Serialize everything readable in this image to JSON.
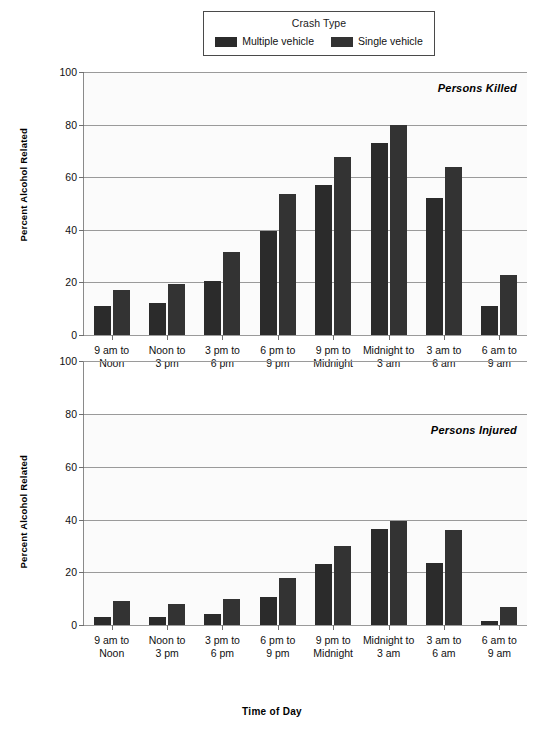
{
  "legend": {
    "title": "Crash Type",
    "entries": [
      {
        "label": "Multiple vehicle",
        "color": "#2b2b2b"
      },
      {
        "label": "Single vehicle",
        "color": "#333333"
      }
    ]
  },
  "axes": {
    "ylabel": "Percent Alcohol Related",
    "xlabel": "Time of Day"
  },
  "panels": [
    {
      "annotation": "Persons Killed"
    },
    {
      "annotation": "Persons Injured"
    }
  ],
  "chart_data": [
    {
      "type": "bar",
      "title": "Persons Killed",
      "xlabel": "Time of Day",
      "ylabel": "Percent Alcohol Related",
      "ylim": [
        0,
        100
      ],
      "yticks": [
        0,
        20,
        40,
        60,
        80,
        100
      ],
      "grid": true,
      "legend_position": "top-center",
      "categories": [
        "9 am to Noon",
        "Noon to 3 pm",
        "3 pm to 6 pm",
        "6 pm to 9 pm",
        "9 pm to Midnight",
        "Midnight to 3 am",
        "3 am to 6 am",
        "6 am to 9 am"
      ],
      "series": [
        {
          "name": "Multiple vehicle",
          "values": [
            11,
            12,
            20.5,
            39.5,
            57,
            73,
            52,
            11
          ]
        },
        {
          "name": "Single vehicle",
          "values": [
            17,
            19.5,
            31.5,
            53.5,
            67.5,
            80,
            64,
            23
          ]
        }
      ]
    },
    {
      "type": "bar",
      "title": "Persons Injured",
      "xlabel": "Time of Day",
      "ylabel": "Percent Alcohol Related",
      "ylim": [
        0,
        100
      ],
      "yticks": [
        0,
        20,
        40,
        60,
        80,
        100
      ],
      "grid": true,
      "legend_position": "top-center",
      "categories": [
        "9 am to Noon",
        "Noon to 3 pm",
        "3 pm to 6 pm",
        "6 pm to 9 pm",
        "9 pm to Midnight",
        "Midnight to 3 am",
        "3 am to 6 am",
        "6 am to 9 am"
      ],
      "series": [
        {
          "name": "Multiple vehicle",
          "values": [
            3,
            3,
            4,
            10.5,
            23,
            36.5,
            23.5,
            1.5
          ]
        },
        {
          "name": "Single vehicle",
          "values": [
            9,
            8,
            10,
            18,
            30,
            39.5,
            36,
            7
          ]
        }
      ]
    }
  ],
  "xtick_labels": [
    {
      "line1": "9 am to",
      "line2": "Noon"
    },
    {
      "line1": "Noon to",
      "line2": "3 pm"
    },
    {
      "line1": "3 pm to",
      "line2": "6 pm"
    },
    {
      "line1": "6 pm to",
      "line2": "9 pm"
    },
    {
      "line1": "9 pm to",
      "line2": "Midnight"
    },
    {
      "line1": "Midnight to",
      "line2": "3 am"
    },
    {
      "line1": "3 am to",
      "line2": "6 am"
    },
    {
      "line1": "6 am to",
      "line2": "9 am"
    }
  ]
}
